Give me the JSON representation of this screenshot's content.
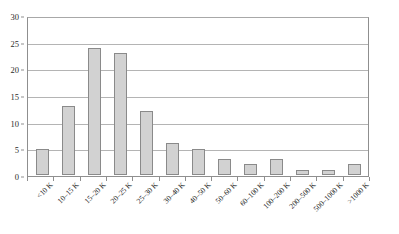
{
  "chart_data": {
    "type": "bar",
    "title": "",
    "subtitle": "",
    "xlabel": "",
    "ylabel": "",
    "ylim": [
      0,
      30
    ],
    "yticks": [
      0,
      5,
      10,
      15,
      20,
      25,
      30
    ],
    "ytick_labels": [
      "0",
      "5",
      "10",
      "15",
      "20",
      "25",
      "30"
    ],
    "grid": true,
    "grid_axis": "y",
    "legend": null,
    "legend_position": "none",
    "orientation": "vertical",
    "categories": [
      "<10 K",
      "10–15 K",
      "15–20 K",
      "20–25 K",
      "25–30 K",
      "30–40 K",
      "40–50 K",
      "50–60 K",
      "60–100 K",
      "100–200 K",
      "200–500 K",
      "500–1000 K",
      ">1000 K"
    ],
    "values": [
      5,
      13,
      24,
      23,
      12,
      6,
      5,
      3,
      2,
      3,
      1,
      1,
      2
    ],
    "bar_fill_color": "#d2d2d2",
    "bar_border_color": "#8a8a8a",
    "grid_color": "#b4b4b4",
    "axis_color": "#8f8f8f",
    "text_color": "#222222",
    "background_color": "#ffffff"
  }
}
